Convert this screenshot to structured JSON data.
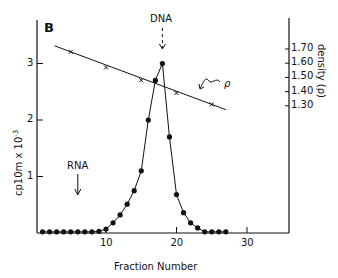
{
  "chart_data": {
    "type": "line",
    "panel_label": "B",
    "title": "",
    "xlabel": "Fraction Number",
    "ylabel": "cp10m x 10",
    "ylabel_exponent": "-3",
    "y2label": "density (ρ)",
    "xlim": [
      0,
      36
    ],
    "ylim": [
      0,
      3.4
    ],
    "y2lim": [
      1.3,
      1.7
    ],
    "x_ticks": [
      10,
      20,
      30
    ],
    "y_ticks": [
      1,
      2,
      3
    ],
    "y2_ticks": [
      "1.70",
      "1.60",
      "1.50",
      "1.40",
      "1.30"
    ],
    "grid": false,
    "annotations": [
      {
        "text": "DNA",
        "x": 18,
        "type": "dashed-arrow-down"
      },
      {
        "text": "RNA",
        "x": 6,
        "type": "arrow-down"
      },
      {
        "text": "ρ",
        "type": "curly-arrow-to-density-line"
      }
    ],
    "series": [
      {
        "name": "cpm",
        "marker": "filled-circle",
        "x": [
          1,
          2,
          3,
          4,
          5,
          6,
          7,
          8,
          9,
          10,
          11,
          12,
          13,
          14,
          15,
          16,
          17,
          18,
          19,
          20,
          21,
          22,
          23,
          24,
          25,
          26,
          27
        ],
        "values": [
          0.02,
          0.02,
          0.02,
          0.02,
          0.02,
          0.02,
          0.02,
          0.02,
          0.03,
          0.07,
          0.18,
          0.32,
          0.51,
          0.75,
          1.1,
          2.0,
          2.7,
          3.0,
          1.7,
          0.68,
          0.36,
          0.18,
          0.09,
          0.02,
          0.02,
          0.02,
          0.02
        ]
      },
      {
        "name": "density (ρ)",
        "marker": "x",
        "axis": "right",
        "x": [
          5,
          10,
          15,
          20,
          25
        ],
        "values": [
          1.68,
          1.57,
          1.48,
          1.39,
          1.31
        ],
        "line_extent_x": [
          2.7,
          27
        ]
      }
    ]
  }
}
